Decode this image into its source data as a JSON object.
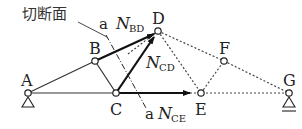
{
  "diagram": {
    "type": "truss-section-method",
    "section_label": "切断面",
    "section_mark_top": "a",
    "section_mark_bottom": "a",
    "nodes": [
      {
        "id": "A",
        "label": "A",
        "x": 28,
        "y": 93,
        "support": "pin"
      },
      {
        "id": "B",
        "label": "B",
        "x": 95,
        "y": 61
      },
      {
        "id": "C",
        "label": "C",
        "x": 116,
        "y": 93
      },
      {
        "id": "D",
        "label": "D",
        "x": 158,
        "y": 31
      },
      {
        "id": "E",
        "label": "E",
        "x": 201,
        "y": 93
      },
      {
        "id": "F",
        "label": "F",
        "x": 224,
        "y": 61
      },
      {
        "id": "G",
        "label": "G",
        "x": 289,
        "y": 93,
        "support": "roller"
      }
    ],
    "members_solid": [
      [
        "A",
        "B"
      ],
      [
        "A",
        "C"
      ],
      [
        "B",
        "C"
      ]
    ],
    "members_dashed": [
      [
        "D",
        "F"
      ],
      [
        "D",
        "E"
      ],
      [
        "E",
        "F"
      ],
      [
        "F",
        "G"
      ],
      [
        "E",
        "G"
      ]
    ],
    "forces": [
      {
        "name": "N",
        "sub": "BD",
        "from": "B",
        "toward": "D"
      },
      {
        "name": "N",
        "sub": "CD",
        "from": "C",
        "toward": "D"
      },
      {
        "name": "N",
        "sub": "CE",
        "from": "C",
        "toward": "E"
      }
    ]
  }
}
